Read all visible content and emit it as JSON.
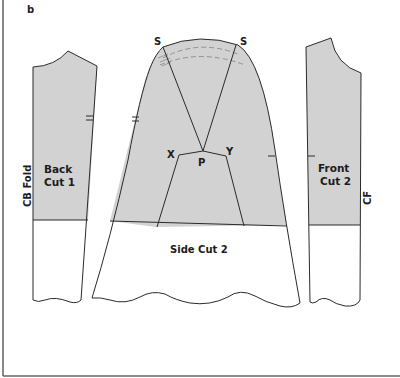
{
  "figure": {
    "panel_label": "b",
    "colors": {
      "shade": "#d2d2d2",
      "line": "#2a2a2a",
      "dash": "#8a8a8a",
      "background": "#ffffff"
    }
  },
  "pieces": {
    "back": {
      "name_line1": "Back",
      "name_line2": "Cut 1",
      "edge_label": "CB Fold"
    },
    "side": {
      "name": "Side Cut 2",
      "point_s_left": "S",
      "point_s_right": "S",
      "point_x": "X",
      "point_p": "P",
      "point_y": "Y"
    },
    "front": {
      "name_line1": "Front",
      "name_line2": "Cut 2",
      "edge_label": "CF"
    }
  }
}
